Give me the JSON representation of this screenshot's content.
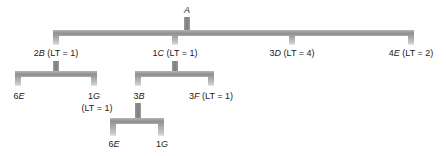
{
  "diagram": {
    "type": "product-structure-tree",
    "root": {
      "qty": "",
      "item": "A",
      "lt": ""
    },
    "level1": [
      {
        "qty": "2",
        "item": "B",
        "lt": "(LT = 1)"
      },
      {
        "qty": "1",
        "item": "C",
        "lt": "(LT = 1)"
      },
      {
        "qty": "3",
        "item": "D",
        "lt": "(LT = 4)"
      },
      {
        "qty": "4",
        "item": "E",
        "lt": "(LT = 2)"
      }
    ],
    "level2_under_B": [
      {
        "qty": "6",
        "item": "E",
        "lt": ""
      },
      {
        "qty": "1",
        "item": "G",
        "lt": "(LT = 1)"
      }
    ],
    "level2_under_C": [
      {
        "qty": "3",
        "item": "B",
        "lt": ""
      },
      {
        "qty": "3",
        "item": "F",
        "lt": "(LT = 1)"
      }
    ],
    "level3_under_B": [
      {
        "qty": "6",
        "item": "E",
        "lt": ""
      },
      {
        "qty": "1",
        "item": "G",
        "lt": ""
      }
    ],
    "colors": {
      "bar": "#9a9a9a",
      "text": "#222222",
      "background": "#ffffff"
    }
  }
}
